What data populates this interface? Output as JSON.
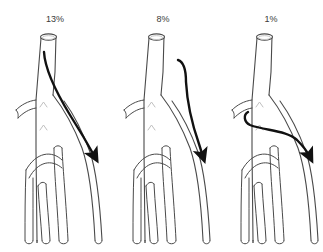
{
  "figure": {
    "background_color": "#ffffff",
    "vessel_outline_color": "#4a4a4a",
    "vessel_fill_color": "#ffffff",
    "vessel_shading_color": "#b8b8b8",
    "catheter_color": "#111111",
    "label_color": "#3a3a3a",
    "width": 323,
    "height": 252
  },
  "panels": [
    {
      "id": "panel-1",
      "label": "13%",
      "label_x": 55,
      "label_y": 22,
      "origin_x": 0,
      "catheter_route": "from-proximal-trunk-into-right-branch",
      "arrow_tip_x": 97,
      "arrow_tip_y": 160
    },
    {
      "id": "panel-2",
      "label": "8%",
      "label_x": 163,
      "label_y": 22,
      "origin_x": 108,
      "catheter_route": "from-lateral-hook-into-right-branch",
      "arrow_tip_x": 205,
      "arrow_tip_y": 160
    },
    {
      "id": "panel-3",
      "label": "1%",
      "label_x": 271,
      "label_y": 22,
      "origin_x": 216,
      "catheter_route": "from-left-branch-across-into-right-branch",
      "arrow_tip_x": 313,
      "arrow_tip_y": 160
    }
  ],
  "anatomy": {
    "trunk_label": "main-trunk",
    "branch_count": 5,
    "side_branch_label": "left-side-branch",
    "chevron_marks": 2
  }
}
